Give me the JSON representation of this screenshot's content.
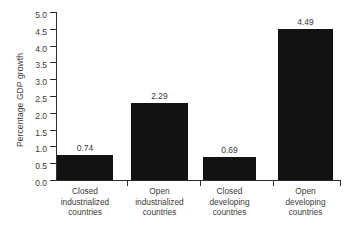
{
  "chart_data": {
    "type": "bar",
    "title": "",
    "xlabel": "",
    "ylabel": "Percentage GDP growth",
    "categories": [
      "Closed industrialized countries",
      "Open industrialized countries",
      "Closed developing countries",
      "Open developing countries"
    ],
    "category_lines": [
      [
        "Closed",
        "industrialized",
        "countries"
      ],
      [
        "Open",
        "industrialized",
        "countries"
      ],
      [
        "Closed",
        "developing",
        "countries"
      ],
      [
        "Open",
        "developing",
        "countries"
      ]
    ],
    "values": [
      0.74,
      2.29,
      0.69,
      4.49
    ],
    "value_labels": [
      "0.74",
      "2.29",
      "0.69",
      "4.49"
    ],
    "ylim": [
      0.0,
      5.0
    ],
    "ytick_values": [
      0.0,
      0.5,
      1.0,
      1.5,
      2.0,
      2.5,
      3.0,
      3.5,
      4.0,
      4.5,
      5.0
    ],
    "ytick_labels": [
      "0.0",
      "0.5",
      "1.0",
      "1.5",
      "2.0",
      "2.5",
      "3.0",
      "3.5",
      "4.0",
      "4.5",
      "5.0"
    ],
    "grid": false,
    "legend": false,
    "bar_color": "#121210",
    "axis_color": "#2e2e2c",
    "text_color": "#3b3b39",
    "background": "#ffffff"
  }
}
